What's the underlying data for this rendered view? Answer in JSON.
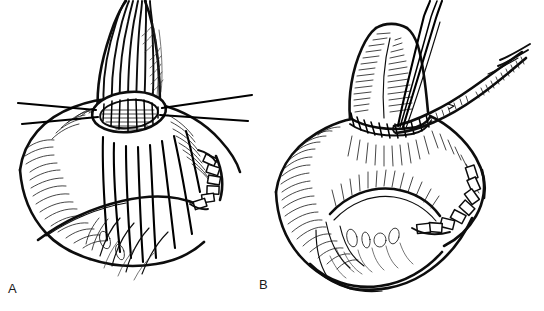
{
  "figure": {
    "kind": "surgical-line-drawing",
    "caption_labels": [
      {
        "id": "a",
        "text": "A"
      },
      {
        "id": "b",
        "text": "B"
      }
    ],
    "background_color": "#ffffff",
    "ink_color": "#0d0d0d",
    "panels": [
      {
        "id": "a",
        "label": "A",
        "description": "Tubular organ end held open by four lateral traction stay sutures, with a row of interrupted full-thickness sutures placed through the anterior wall of the adjacent viscus; a stapled closure line runs along the right border.",
        "elements": [
          {
            "name": "tubular-conduit",
            "count": 1
          },
          {
            "name": "traction-stay-suture",
            "count": 4
          },
          {
            "name": "interrupted-suture-strand",
            "count": 8
          },
          {
            "name": "stapled-closure-line",
            "count": 1
          },
          {
            "name": "serosal-hatching",
            "count": 1
          }
        ]
      },
      {
        "id": "b",
        "label": "B",
        "description": "Completed end-to-side anastomosis with a running suture line at the junction; a forceps grasps the tissue edge and two suture needles remain in view. The stapled closure line is visible along the right inferior border.",
        "elements": [
          {
            "name": "tubular-conduit",
            "count": 1
          },
          {
            "name": "completed-anastomosis-suture-line",
            "count": 1
          },
          {
            "name": "forceps-instrument",
            "count": 1
          },
          {
            "name": "needle-shaft",
            "count": 3
          },
          {
            "name": "stapled-closure-line",
            "count": 1
          },
          {
            "name": "serosal-hatching",
            "count": 1
          }
        ]
      }
    ]
  }
}
